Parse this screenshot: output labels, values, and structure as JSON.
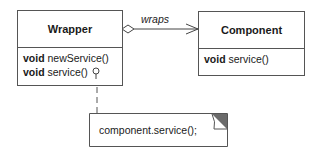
{
  "diagram": {
    "type": "uml-class",
    "classes": [
      {
        "name": "Wrapper",
        "operations": [
          {
            "return": "void",
            "signature": "newService()"
          },
          {
            "return": "void",
            "signature": "service()"
          }
        ]
      },
      {
        "name": "Component",
        "operations": [
          {
            "return": "void",
            "signature": "service()"
          }
        ]
      }
    ],
    "association": {
      "label": "wraps",
      "from": "Wrapper",
      "to": "Component",
      "kind": "aggregation, navigable"
    },
    "note": {
      "text": "component.service();",
      "attached_to": "Wrapper.service()"
    }
  }
}
